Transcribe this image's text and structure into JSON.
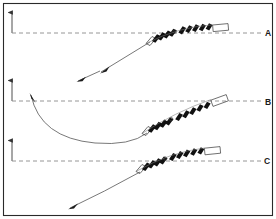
{
  "figure": {
    "background_color": "#ffffff",
    "border_color": "#2a2a2a",
    "ink_color": "#111111",
    "dashed_color": "#8a8a8a",
    "trajectory_color": "#555555",
    "width": 276,
    "height": 219
  },
  "panels": [
    {
      "id": "A",
      "label": "A",
      "baseline_y": 33,
      "axis_arrow": {
        "x": 12,
        "y_top": 11,
        "y_bottom": 33,
        "label": ""
      },
      "approach": "straight line rising from lower left",
      "approach_arrow_direction": "down-left",
      "strip": {
        "blade_count": 9,
        "open_cell_at_end": true,
        "marker_dot": true
      }
    },
    {
      "id": "B",
      "label": "B",
      "baseline_y": 101,
      "axis_arrow": {
        "x": 12,
        "y_top": 79,
        "y_bottom": 101,
        "label": ""
      },
      "approach": "deep U-shaped curve dipping below baseline",
      "approach_arrow_direction": "up-left",
      "strip": {
        "blade_count": 9,
        "open_cell_at_end": true,
        "marker_dot": true
      }
    },
    {
      "id": "C",
      "label": "C",
      "baseline_y": 161,
      "axis_arrow": {
        "x": 12,
        "y_top": 140,
        "y_bottom": 161,
        "label": ""
      },
      "approach": "gentle curve rising from lower left",
      "approach_arrow_direction": "down-left",
      "strip": {
        "blade_count": 9,
        "open_cell_at_end": true,
        "marker_dot": true
      }
    }
  ],
  "stray_marks": [
    {
      "name": "upper-detached-arrow",
      "panel": "B",
      "direction": "down-left"
    },
    {
      "name": "lower-detached-arrow",
      "panel": "C",
      "direction": "down-left"
    }
  ]
}
